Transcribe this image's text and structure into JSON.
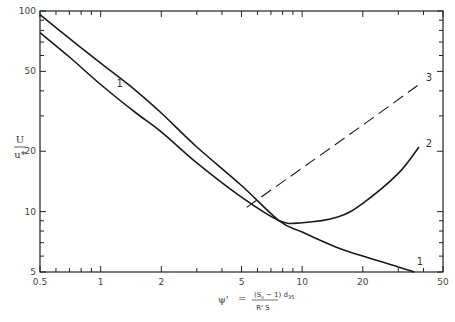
{
  "chart_data": {
    "type": "line",
    "title": "",
    "xlabel": "ψ' = (S_s − 1) d_35 / (R' S)",
    "xlabel_parts": {
      "lhs": "ψ'",
      "eq": "=",
      "numerator": "(S",
      "numerator_sub": "s",
      "numerator_rest": " − 1) d",
      "numerator_sub2": "35",
      "denominator": "R' S"
    },
    "ylabel": "U / u*",
    "ylabel_parts": {
      "numerator": "U",
      "denominator": "u*"
    },
    "xscale": "log",
    "yscale": "log",
    "xlim": [
      0.5,
      50
    ],
    "ylim": [
      5,
      100
    ],
    "grid": false,
    "legend": "none (inline curve labels)",
    "x_ticks": [
      {
        "value": 0.5,
        "label": "0.5"
      },
      {
        "value": 1,
        "label": "1"
      },
      {
        "value": 2,
        "label": "2"
      },
      {
        "value": 5,
        "label": "5"
      },
      {
        "value": 10,
        "label": "10"
      },
      {
        "value": 20,
        "label": "20"
      },
      {
        "value": 50,
        "label": "50"
      }
    ],
    "y_ticks": [
      {
        "value": 5,
        "label": "5"
      },
      {
        "value": 10,
        "label": "10"
      },
      {
        "value": 20,
        "label": "20"
      },
      {
        "value": 50,
        "label": "50"
      },
      {
        "value": 100,
        "label": "100"
      }
    ],
    "series": [
      {
        "name": "1",
        "style": "solid",
        "x": [
          0.5,
          0.7,
          1.0,
          1.5,
          2.0,
          3.0,
          5.0,
          7.7,
          10,
          15,
          20,
          30,
          36
        ],
        "y": [
          96,
          73,
          55,
          40,
          31,
          21,
          13.5,
          9.0,
          7.9,
          6.6,
          6.0,
          5.3,
          5.0
        ],
        "labels": [
          {
            "text": "1",
            "x": 1.2,
            "y": 42
          },
          {
            "text": "1",
            "x": 37,
            "y": 5.4
          }
        ]
      },
      {
        "name": "2",
        "style": "solid",
        "x": [
          0.5,
          0.7,
          1.0,
          1.5,
          2.0,
          3.0,
          5.0,
          7.7,
          10,
          15,
          20,
          30,
          38
        ],
        "y": [
          78,
          59,
          43,
          31,
          25,
          17.5,
          11.8,
          9.0,
          8.8,
          9.4,
          11.0,
          15.5,
          21
        ],
        "labels": [
          {
            "text": "2",
            "x": 41,
            "y": 21
          }
        ]
      },
      {
        "name": "3",
        "style": "dashed",
        "x": [
          5.3,
          10,
          20,
          38
        ],
        "y": [
          10.5,
          16.5,
          27,
          43
        ],
        "labels": [
          {
            "text": "3",
            "x": 41,
            "y": 45
          }
        ]
      }
    ]
  }
}
